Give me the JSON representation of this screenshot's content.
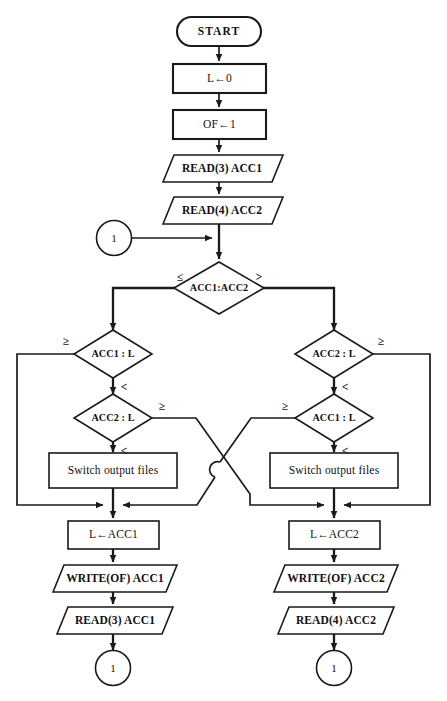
{
  "diagram": {
    "style": {
      "line_color": "#1a1a1a",
      "fill_color": "#ffffff",
      "background": "#ffffff"
    },
    "nodes": {
      "start": {
        "label": "START",
        "shape": "terminator"
      },
      "init_l": {
        "label": "L←0",
        "shape": "process"
      },
      "init_of": {
        "label": "OF←1",
        "shape": "process"
      },
      "read3_top": {
        "label": "READ(3) ACC1",
        "shape": "io"
      },
      "read4_top": {
        "label": "READ(4) ACC2",
        "shape": "io"
      },
      "conn_entry": {
        "label": "1",
        "shape": "connector"
      },
      "dec_main": {
        "label": "ACC1:ACC2",
        "shape": "decision"
      },
      "dec_l_acc1": {
        "label": "ACC1 : L",
        "shape": "decision"
      },
      "dec_l_acc2": {
        "label": "ACC2 : L",
        "shape": "decision"
      },
      "dec_r_acc2": {
        "label": "ACC2 : L",
        "shape": "decision"
      },
      "dec_r_acc1": {
        "label": "ACC1 : L",
        "shape": "decision"
      },
      "switch_left": {
        "label": "Switch output files",
        "shape": "process"
      },
      "switch_right": {
        "label": "Switch output files",
        "shape": "process"
      },
      "set_l_acc1": {
        "label": "L←ACC1",
        "shape": "process"
      },
      "set_l_acc2": {
        "label": "L←ACC2",
        "shape": "process"
      },
      "write_acc1": {
        "label": "WRITE(OF) ACC1",
        "shape": "io"
      },
      "write_acc2": {
        "label": "WRITE(OF) ACC2",
        "shape": "io"
      },
      "read3_bot": {
        "label": "READ(3) ACC1",
        "shape": "io"
      },
      "read4_bot": {
        "label": "READ(4) ACC2",
        "shape": "io"
      },
      "conn_exit_l": {
        "label": "1",
        "shape": "connector"
      },
      "conn_exit_r": {
        "label": "1",
        "shape": "connector"
      }
    },
    "branch_labels": {
      "main_left": "≤",
      "main_right": ">",
      "l_acc1_ge": "≥",
      "l_acc1_lt": "<",
      "l_acc2_ge": "≥",
      "l_acc2_lt": "<",
      "r_acc2_ge": "≥",
      "r_acc2_lt": "<",
      "r_acc1_ge": "≥",
      "r_acc1_lt": "<"
    }
  }
}
